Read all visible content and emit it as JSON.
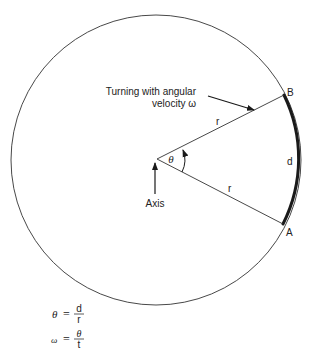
{
  "diagram": {
    "labels": {
      "pointer_line1": "Turning with angular",
      "pointer_line2": "velocity ω",
      "point_b": "B",
      "point_a": "A",
      "arc_length": "d",
      "radius_upper": "r",
      "radius_lower": "r",
      "angle": "θ",
      "axis": "Axis"
    },
    "equations": [
      {
        "lhs": "θ",
        "equals": "=",
        "numerator": "d",
        "denominator": "r"
      },
      {
        "lhs": "ω",
        "equals": "=",
        "numerator": "θ",
        "denominator": "t"
      }
    ],
    "geometry": {
      "circle_center": [
        156,
        160
      ],
      "circle_radius": 145,
      "vertex": [
        157,
        159
      ],
      "point_b": [
        284,
        95
      ],
      "point_a": [
        283,
        224
      ]
    },
    "colors": {
      "stroke": "#333333",
      "arc": "#1a1a1a",
      "background": "#ffffff"
    }
  }
}
